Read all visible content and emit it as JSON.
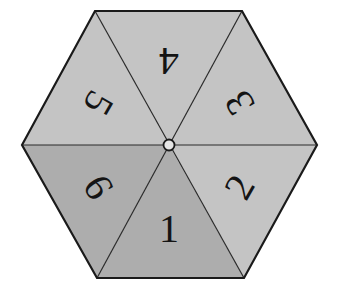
{
  "spinner": {
    "shape": "hexagon",
    "colors": {
      "light": "#c4c4c4",
      "dark": "#adadad",
      "stroke": "#1a1a1a",
      "hub": "#e6e6e6"
    },
    "sectors": [
      {
        "label": "1",
        "shade": "dark"
      },
      {
        "label": "2",
        "shade": "light"
      },
      {
        "label": "3",
        "shade": "light"
      },
      {
        "label": "4",
        "shade": "light"
      },
      {
        "label": "5",
        "shade": "light"
      },
      {
        "label": "6",
        "shade": "dark"
      }
    ]
  }
}
